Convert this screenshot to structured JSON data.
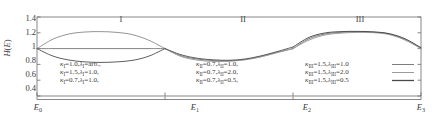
{
  "chart_data": {
    "type": "line",
    "title": "",
    "xlabel": "",
    "ylabel": "H(E)",
    "ylim": [
      0.4,
      1.4
    ],
    "ytick_labels": [
      "1.4",
      "1.2",
      "1",
      "0.8",
      "0.6",
      "0.4"
    ],
    "ytick_values": [
      1.4,
      1.2,
      1.0,
      0.8,
      0.6,
      0.4
    ],
    "xtick_labels": [
      "E0",
      "E1",
      "E2",
      "E3"
    ],
    "xtick_values": [
      0.0,
      1.0,
      2.0,
      3.0
    ],
    "xlim": [
      0.0,
      3.0
    ],
    "grid": false,
    "legend_position": "inside-bottom",
    "region_labels": [
      "I",
      "II",
      "III"
    ],
    "series": [
      {
        "name": "kappa_I=1.0, lambda_I=arb.",
        "region": "I",
        "color": "#7d7d7d",
        "x": [
          0.0,
          0.125,
          0.25,
          0.375,
          0.5,
          0.625,
          0.75,
          0.875,
          1.0
        ],
        "values": [
          1.0,
          1.0,
          1.0,
          1.0,
          1.0,
          1.0,
          1.0,
          1.0,
          1.0
        ]
      },
      {
        "name": "kappa_I=1.5, lambda_I=1.0",
        "region": "I",
        "color": "#8f8f8f",
        "x": [
          0.0,
          0.125,
          0.25,
          0.375,
          0.5,
          0.625,
          0.75,
          0.875,
          1.0
        ],
        "values": [
          1.0,
          1.12,
          1.185,
          1.21,
          1.215,
          1.205,
          1.175,
          1.105,
          1.0
        ]
      },
      {
        "name": "kappa_I=0.7, lambda_I=1.0",
        "region": "I",
        "color": "#565656",
        "x": [
          0.0,
          0.125,
          0.25,
          0.375,
          0.5,
          0.625,
          0.75,
          0.875,
          1.0
        ],
        "values": [
          1.0,
          0.905,
          0.855,
          0.832,
          0.825,
          0.832,
          0.852,
          0.905,
          1.0
        ]
      },
      {
        "name": "kappa_II=0.7, lambda_II=1.0",
        "region": "II",
        "color": "#7d7d7d",
        "x": [
          1.0,
          1.125,
          1.25,
          1.375,
          1.5,
          1.625,
          1.75,
          1.875,
          2.0
        ],
        "values": [
          1.0,
          0.91,
          0.868,
          0.848,
          0.845,
          0.862,
          0.9,
          0.952,
          1.0
        ]
      },
      {
        "name": "kappa_II=0.7, lambda_II=2.0",
        "region": "II",
        "color": "#9a9a9a",
        "x": [
          1.0,
          1.125,
          1.25,
          1.375,
          1.5,
          1.625,
          1.75,
          1.875,
          2.0
        ],
        "values": [
          1.0,
          0.9,
          0.855,
          0.838,
          0.84,
          0.858,
          0.895,
          0.948,
          1.0
        ]
      },
      {
        "name": "kappa_II=0.7, lambda_II=0.5",
        "region": "II",
        "color": "#565656",
        "x": [
          1.0,
          1.125,
          1.25,
          1.375,
          1.5,
          1.625,
          1.75,
          1.875,
          2.0
        ],
        "values": [
          1.0,
          0.922,
          0.878,
          0.858,
          0.852,
          0.868,
          0.908,
          0.962,
          1.02
        ]
      },
      {
        "name": "kappa_III=1.5, lambda_III=1.0",
        "region": "III",
        "color": "#7d7d7d",
        "x": [
          2.0,
          2.125,
          2.25,
          2.375,
          2.5,
          2.625,
          2.75,
          2.875,
          3.0
        ],
        "values": [
          1.0,
          1.125,
          1.185,
          1.205,
          1.212,
          1.208,
          1.185,
          1.115,
          1.005
        ]
      },
      {
        "name": "kappa_III=1.5, lambda_III=2.0",
        "region": "III",
        "color": "#9a9a9a",
        "x": [
          2.0,
          2.125,
          2.25,
          2.375,
          2.5,
          2.625,
          2.75,
          2.875,
          3.0
        ],
        "values": [
          1.0,
          1.108,
          1.172,
          1.196,
          1.205,
          1.202,
          1.178,
          1.108,
          1.0
        ]
      },
      {
        "name": "kappa_III=1.5, lambda_III=0.5",
        "region": "III",
        "color": "#4a4a4a",
        "x": [
          2.0,
          2.125,
          2.25,
          2.375,
          2.5,
          2.625,
          2.75,
          2.875,
          3.0
        ],
        "values": [
          1.02,
          1.142,
          1.198,
          1.215,
          1.218,
          1.212,
          1.19,
          1.125,
          1.012
        ]
      }
    ]
  },
  "axes": {
    "yticks": [
      {
        "label": "1.4",
        "value": 1.4
      },
      {
        "label": "1.2",
        "value": 1.2
      },
      {
        "label": "1",
        "value": 1.0
      },
      {
        "label": "0.8",
        "value": 0.8
      },
      {
        "label": "0.6",
        "value": 0.6
      },
      {
        "label": "0.4",
        "value": 0.4
      }
    ],
    "ylabel_main": "H",
    "ylabel_paren_open": "(",
    "ylabel_arg": "E",
    "ylabel_paren_close": ")",
    "xticks": [
      {
        "base": "E",
        "sub": "0"
      },
      {
        "base": "E",
        "sub": "1"
      },
      {
        "base": "E",
        "sub": "2"
      },
      {
        "base": "E",
        "sub": "3"
      }
    ]
  },
  "regions": [
    {
      "label": "I"
    },
    {
      "label": "II"
    },
    {
      "label": "III"
    }
  ],
  "legends": {
    "region_I": {
      "lines": [
        {
          "k_sym": "κ",
          "k_sub": "I",
          "k_val": "=1.0,",
          "l_sym": "λ",
          "l_sub": "I",
          "l_val": "=arb.,"
        },
        {
          "k_sym": "κ",
          "k_sub": "I",
          "k_val": "=1.5,",
          "l_sym": "λ",
          "l_sub": "I",
          "l_val": "=1.0,"
        },
        {
          "k_sym": "κ",
          "k_sub": "I",
          "k_val": "=0.7,",
          "l_sym": "λ",
          "l_sub": "I",
          "l_val": "=1.0,"
        }
      ]
    },
    "region_II": {
      "lines": [
        {
          "k_sym": "κ",
          "k_sub": "II",
          "k_val": "=0.7,",
          "l_sym": "λ",
          "l_sub": "II",
          "l_val": "=1.0,"
        },
        {
          "k_sym": "κ",
          "k_sub": "II",
          "k_val": "=0.7,",
          "l_sym": "λ",
          "l_sub": "II",
          "l_val": "=2.0,"
        },
        {
          "k_sym": "κ",
          "k_sub": "II",
          "k_val": "=0.7,",
          "l_sym": "λ",
          "l_sub": "II",
          "l_val": "=0.5,"
        }
      ]
    },
    "region_III": {
      "lines": [
        {
          "k_sym": "κ",
          "k_sub": "III",
          "k_val": "=1.5,",
          "l_sym": "λ",
          "l_sub": "III",
          "l_val": "=1.0"
        },
        {
          "k_sym": "κ",
          "k_sub": "III",
          "k_val": "=1.5,",
          "l_sym": "λ",
          "l_sub": "III",
          "l_val": "=2.0"
        },
        {
          "k_sym": "κ",
          "k_sub": "III",
          "k_val": "=1.5,",
          "l_sym": "λ",
          "l_sub": "III",
          "l_val": "=0.5"
        }
      ]
    },
    "swatch_colors": [
      "#7d7d7d",
      "#9a9a9a",
      "#4a4a4a"
    ]
  },
  "style": {
    "axis_color": "#6a6a6a",
    "text_color": "#3a3a3a",
    "background": "#ffffff"
  }
}
